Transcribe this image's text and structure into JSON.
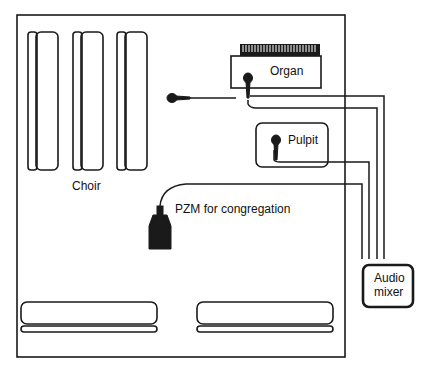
{
  "diagram": {
    "type": "floor-plan-wiring",
    "labels": {
      "choir": "Choir",
      "organ": "Organ",
      "pulpit": "Pulpit",
      "pzm": "PZM for congregation",
      "mixer_line1": "Audio",
      "mixer_line2": "mixer"
    },
    "components": [
      {
        "id": "choir-mic",
        "kind": "microphone",
        "connects_to": "audio-mixer"
      },
      {
        "id": "organ-mic",
        "kind": "microphone",
        "connects_to": "audio-mixer"
      },
      {
        "id": "pulpit-mic",
        "kind": "microphone",
        "connects_to": "audio-mixer"
      },
      {
        "id": "pzm-mic",
        "kind": "pressure-zone-microphone",
        "connects_to": "audio-mixer"
      }
    ],
    "colors": {
      "stroke": "#1a1a1a",
      "background": "#ffffff"
    }
  }
}
